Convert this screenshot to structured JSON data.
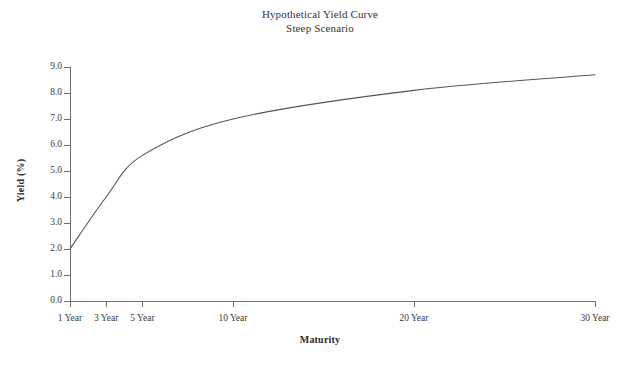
{
  "chart_data": {
    "type": "line",
    "title": "Hypothetical Yield Curve",
    "subtitle": "Steep Scenario",
    "xlabel": "Maturity",
    "ylabel": "Yield (%)",
    "categories": [
      "1 Year",
      "3 Year",
      "5 Year",
      "10 Year",
      "20 Year",
      "30 Year"
    ],
    "x_positions": [
      0,
      2,
      4,
      9,
      19,
      29
    ],
    "values": [
      2.0,
      4.0,
      5.6,
      7.0,
      8.1,
      8.7
    ],
    "ylim": [
      0.0,
      9.0
    ],
    "ytick_labels": [
      "0.0",
      "1.0",
      "2.0",
      "3.0",
      "4.0",
      "5.0",
      "6.0",
      "7.0",
      "8.0",
      "9.0"
    ],
    "ytick_values": [
      0.0,
      1.0,
      2.0,
      3.0,
      4.0,
      5.0,
      6.0,
      7.0,
      8.0,
      9.0
    ],
    "grid": false,
    "legend": "none",
    "line_color": "#555555",
    "axis_color": "#6e6e6e",
    "background_color": "#ffffff"
  }
}
